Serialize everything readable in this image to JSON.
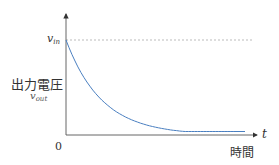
{
  "chart_data": {
    "type": "line",
    "title": "",
    "xlabel": "時間",
    "xlabel_symbol": "t",
    "ylabel": "出力電圧",
    "ylabel_symbol": "v_out",
    "origin_label": "0",
    "reference_line": {
      "label": "v_in",
      "value": 1.0,
      "style": "dashed",
      "color": "#999999"
    },
    "series": [
      {
        "name": "v_out(t)",
        "color": "#4a7fc1",
        "description": "exponential decay from v_in toward 0",
        "x": [
          0,
          0.5,
          1,
          1.5,
          2,
          2.5,
          3,
          3.5,
          4,
          4.5,
          5
        ],
        "values": [
          1.0,
          0.61,
          0.37,
          0.22,
          0.14,
          0.08,
          0.05,
          0.03,
          0.02,
          0.01,
          0.007
        ]
      }
    ],
    "xlim": [
      0,
      5.3
    ],
    "ylim": [
      0,
      1.3
    ],
    "grid": false,
    "legend": false,
    "ticks": false
  },
  "labels": {
    "v_in_main": "v",
    "v_in_sub": "in",
    "v_out_main": "v",
    "v_out_sub": "out",
    "ylabel": "出力電圧",
    "xlabel": "時間",
    "t_symbol": "t",
    "origin": "0"
  }
}
